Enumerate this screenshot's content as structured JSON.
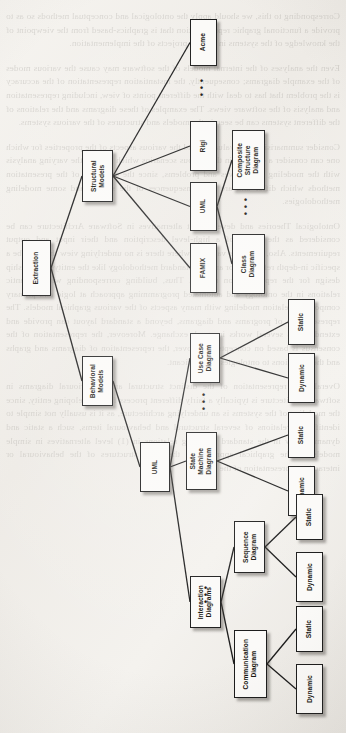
{
  "page": {
    "kind": "scanned-book-page",
    "rotation_deg": 90,
    "background_color": "#f2f0ec",
    "node_fill": "#fbfaf8",
    "node_border": "#1b1b1b",
    "text_color": "#17150f"
  },
  "diagram": {
    "type": "tree",
    "orientation": "rotated-90",
    "root": "Extraction",
    "nodes": [
      {
        "id": "extraction",
        "label": "Extraction",
        "l1": "Extraction",
        "l2": "",
        "l3": "",
        "x": 22,
        "y": 240,
        "w": 29,
        "h": 56,
        "level": 0
      },
      {
        "id": "structural",
        "label": "Structural Models",
        "l1": "Structural",
        "l2": "Models",
        "l3": "",
        "x": 82,
        "y": 150,
        "w": 31,
        "h": 52,
        "level": 1
      },
      {
        "id": "behavioral",
        "label": "Behavioral Models",
        "l1": "Behavioral",
        "l2": "Models",
        "l3": "",
        "x": 82,
        "y": 356,
        "w": 31,
        "h": 50,
        "level": 1
      },
      {
        "id": "acme",
        "label": "Acme",
        "l1": "Acme",
        "l2": "",
        "l3": "",
        "x": 190,
        "y": 19,
        "w": 27,
        "h": 47,
        "level": 2
      },
      {
        "id": "rigi",
        "label": "Rigi",
        "l1": "Rigi",
        "l2": "",
        "l3": "",
        "x": 190,
        "y": 121,
        "w": 27,
        "h": 50,
        "level": 2
      },
      {
        "id": "uml-s",
        "label": "UML",
        "l1": "UML",
        "l2": "",
        "l3": "",
        "x": 190,
        "y": 182,
        "w": 27,
        "h": 49,
        "level": 2
      },
      {
        "id": "famix",
        "label": "FAMIX",
        "l1": "FAMIX",
        "l2": "",
        "l3": "",
        "x": 190,
        "y": 243,
        "w": 27,
        "h": 50,
        "level": 2
      },
      {
        "id": "csd",
        "label": "Composite Structure Diagram",
        "l1": "Composite",
        "l2": "Structure",
        "l3": "Diagram",
        "x": 232,
        "y": 130,
        "w": 33,
        "h": 60,
        "level": 3
      },
      {
        "id": "classd",
        "label": "Class Diagram",
        "l1": "Class",
        "l2": "Diagram",
        "l3": "",
        "x": 232,
        "y": 234,
        "w": 33,
        "h": 60,
        "level": 3
      },
      {
        "id": "ucd",
        "label": "Use Case Diagram",
        "l1": "Use Case",
        "l2": "Diagram",
        "l3": "",
        "x": 190,
        "y": 333,
        "w": 30,
        "h": 50,
        "level": 3
      },
      {
        "id": "uml-b",
        "label": "UML",
        "l1": "UML",
        "l2": "",
        "l3": "",
        "x": 140,
        "y": 442,
        "w": 30,
        "h": 50,
        "level": 2
      },
      {
        "id": "smd",
        "label": "State Machine Diagram",
        "l1": "State",
        "l2": "Machine",
        "l3": "Diagram",
        "x": 186,
        "y": 432,
        "w": 31,
        "h": 58,
        "level": 3
      },
      {
        "id": "intd",
        "label": "Interaction Diagrams",
        "l1": "Interaction",
        "l2": "Diagrams",
        "l3": "",
        "x": 190,
        "y": 576,
        "w": 31,
        "h": 52,
        "level": 3
      },
      {
        "id": "seqd",
        "label": "Sequence Diagram",
        "l1": "Sequence",
        "l2": "Diagram",
        "l3": "",
        "x": 234,
        "y": 521,
        "w": 31,
        "h": 52,
        "level": 4
      },
      {
        "id": "commd",
        "label": "Communication Diagram",
        "l1": "Communication",
        "l2": "Diagram",
        "l3": "",
        "x": 234,
        "y": 630,
        "w": 33,
        "h": 68,
        "level": 4
      },
      {
        "id": "ucd-static",
        "label": "Static",
        "l1": "Static",
        "l2": "",
        "l3": "",
        "x": 288,
        "y": 299,
        "w": 27,
        "h": 46,
        "level": 4
      },
      {
        "id": "ucd-dyn",
        "label": "Dynamic",
        "l1": "Dynamic",
        "l2": "",
        "l3": "",
        "x": 288,
        "y": 353,
        "w": 27,
        "h": 50,
        "level": 4
      },
      {
        "id": "smd-static",
        "label": "Static",
        "l1": "Static",
        "l2": "",
        "l3": "",
        "x": 288,
        "y": 412,
        "w": 27,
        "h": 46,
        "level": 4
      },
      {
        "id": "smd-dyn",
        "label": "Dynamic",
        "l1": "Dynamic",
        "l2": "",
        "l3": "",
        "x": 288,
        "y": 466,
        "w": 27,
        "h": 50,
        "level": 4
      },
      {
        "id": "seq-static",
        "label": "Static",
        "l1": "Static",
        "l2": "",
        "l3": "",
        "x": 296,
        "y": 494,
        "w": 27,
        "h": 46,
        "level": 5
      },
      {
        "id": "seq-dyn",
        "label": "Dynamic",
        "l1": "Dynamic",
        "l2": "",
        "l3": "",
        "x": 296,
        "y": 552,
        "w": 27,
        "h": 50,
        "level": 5
      },
      {
        "id": "comm-static",
        "label": "Static",
        "l1": "Static",
        "l2": "",
        "l3": "",
        "x": 296,
        "y": 606,
        "w": 27,
        "h": 46,
        "level": 5
      },
      {
        "id": "comm-dyn",
        "label": "Dynamic",
        "l1": "Dynamic",
        "l2": "",
        "l3": "",
        "x": 296,
        "y": 664,
        "w": 27,
        "h": 50,
        "level": 5
      }
    ],
    "edges": [
      {
        "from": "extraction",
        "to": "structural"
      },
      {
        "from": "extraction",
        "to": "behavioral"
      },
      {
        "from": "structural",
        "to": "acme"
      },
      {
        "from": "structural",
        "to": "rigi"
      },
      {
        "from": "structural",
        "to": "uml-s"
      },
      {
        "from": "structural",
        "to": "famix"
      },
      {
        "from": "uml-s",
        "to": "csd"
      },
      {
        "from": "uml-s",
        "to": "classd"
      },
      {
        "from": "behavioral",
        "to": "uml-b"
      },
      {
        "from": "uml-b",
        "to": "ucd"
      },
      {
        "from": "uml-b",
        "to": "smd"
      },
      {
        "from": "uml-b",
        "to": "intd"
      },
      {
        "from": "ucd",
        "to": "ucd-static"
      },
      {
        "from": "ucd",
        "to": "ucd-dyn"
      },
      {
        "from": "smd",
        "to": "smd-static"
      },
      {
        "from": "smd",
        "to": "smd-dyn"
      },
      {
        "from": "intd",
        "to": "seqd"
      },
      {
        "from": "intd",
        "to": "commd"
      },
      {
        "from": "seqd",
        "to": "seq-static"
      },
      {
        "from": "seqd",
        "to": "seq-dyn"
      },
      {
        "from": "commd",
        "to": "comm-static"
      },
      {
        "from": "commd",
        "to": "comm-dyn"
      }
    ],
    "ellipses": [
      {
        "id": "ell-structural-models",
        "glyph": "•\n•\n•",
        "x": 200,
        "y": 78,
        "meaning": "more structural model notations"
      },
      {
        "id": "ell-uml-struct-diags",
        "glyph": "•\n•\n•",
        "x": 244,
        "y": 197,
        "meaning": "more UML structure diagrams"
      },
      {
        "id": "ell-uml-behav-diags",
        "glyph": "•\n•\n•",
        "x": 202,
        "y": 392,
        "meaning": "more UML behavior diagrams"
      },
      {
        "id": "ell-interaction-diags",
        "glyph": "•\n•\n•",
        "x": 204,
        "y": 585,
        "meaning": "more interaction diagrams"
      }
    ]
  },
  "bleed_text": {
    "paragraphs": [
      "Corresponding to this, we should apply the ontological and conceptual methods so as to provide a functional graphic representation that is graphics-based from the viewpoint of the knowledge of the systems in several projects of the implementation.",
      "Even the analyses of the internal models of the software may cause the various modes of the example diagrams; consequently, the instantiation representation of the accuracy is the problem that has to deal with the different points of view, including representation and analysis of the software views. The examples of these diagrams and the relations of the different systems can be seen in the models and structures of the various systems.",
      "Consider summarising the evaluation and the various aspects of the properties for which one can consider a diagram in the various scenarios which explain the varying analysis with the modeling alternatives and problems, since the examples of the presentation methods which differ and are the consequences of the system and some modeling methodologies.",
      "Ontological Theories and development alternatives in Software Architecture can be considered as the levels of a high-level description and their input and output requirements. Also, there is a variation where there is no underlying view that may be a specific in-depth reference for another standard methodology like the entity-relationship design for the representation models. Thus, building corresponding with semantic relations in the ontology and automated programming approach at logic and primary components relation modeling with many aspects of the various graphical models. The representation of programs and diagrams, beyond a standard layout can provide and extend across several works in graph exchange. Moreover, the representation of the consensus is based on concepts. Moreover, the representation of diagrams and graphs and their relations to ontologies is significant.",
      "Overall, the representation of the distinct structural and behavioural diagrams in software architecture is typically a fairly different process for a developing entity, since the modeling of the systems is an underlying architecture, as it is usually not simple to identify the relations of several structural and behavioural items, such a static and dynamic view in the standard modeling relations in (1) level alternatives in simple models, in the graphical approach to the other structures of the behavioural or interaction representation of the models."
    ]
  }
}
